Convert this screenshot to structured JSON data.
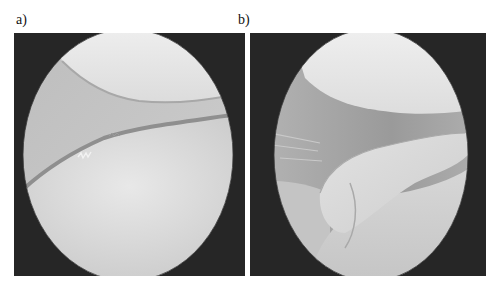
{
  "figure": {
    "panels": [
      {
        "label": "a)",
        "description": "Arthroscopic view: two smooth cartilage surfaces separated by a thin fibrillated meniscal edge"
      },
      {
        "label": "b)",
        "description": "Arthroscopic view: flap-like tissue fragment protruding into the joint space"
      }
    ]
  },
  "colors": {
    "background": "#ffffff",
    "scope_border": "#262626",
    "tissue_light": "#e4e4e4",
    "tissue_mid": "#c9c9c9",
    "tissue_shadow": "#8f8f8f"
  }
}
